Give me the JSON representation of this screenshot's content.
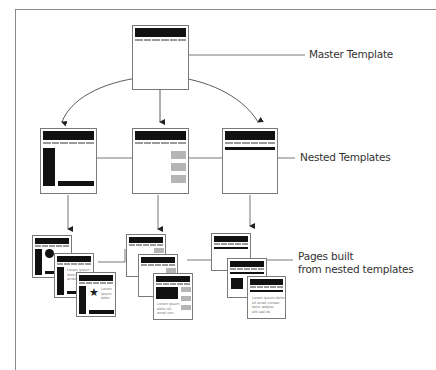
{
  "labels": {
    "master": "Master Template",
    "nested": "Nested Templates",
    "pages_line1": "Pages built",
    "pages_line2": "from nested templates"
  },
  "nodes": {
    "master_template": {
      "type": "master",
      "children": [
        "nested_left",
        "nested_center",
        "nested_right"
      ]
    },
    "nested_templates": [
      {
        "id": "nested_left",
        "layout": "left-sidebar-with-footer-bar"
      },
      {
        "id": "nested_center",
        "layout": "right-column-gray-boxes"
      },
      {
        "id": "nested_right",
        "layout": "subnav-bar"
      }
    ],
    "page_stacks": [
      {
        "from": "nested_left",
        "pages": 3,
        "content_text": "Lorem ipsum dolor sit"
      },
      {
        "from": "nested_center",
        "pages": 3,
        "content_text": "Lorem ipsum dolor sit"
      },
      {
        "from": "nested_right",
        "pages": 3,
        "content_text": "Lorem ipsum dolor sit amet"
      }
    ]
  },
  "page_text": {
    "star_caption": "Lorem\nipsum\ndolor",
    "left_text": "Lorem ipsum\ndolor sit\namet con",
    "center_text": "Lorem ipsum\ndolor sit\namet con",
    "right_text": "Lorem ipsum dolor\nsit amet consec\ntetur adipisc\nelit sed do"
  },
  "colors": {
    "line": "#555555",
    "block": "#111111",
    "gray_box": "#b5b5b5",
    "frame": "#8a8a8a"
  }
}
